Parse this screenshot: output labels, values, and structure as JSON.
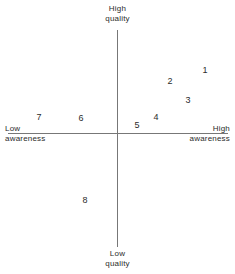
{
  "chart_data": {
    "type": "scatter",
    "title": "",
    "subtitle": "",
    "xlabel": "awareness",
    "ylabel": "quality",
    "xlim": [
      -1,
      1
    ],
    "ylim": [
      -1,
      1
    ],
    "grid": false,
    "legend": null,
    "axes": {
      "vertical": {
        "top_label": {
          "line1": "High",
          "line2": "quality"
        },
        "bottom_label": {
          "line1": "Low",
          "line2": "quality"
        }
      },
      "horizontal": {
        "left_label": {
          "line1": "Low",
          "line2": "awareness"
        },
        "right_label": {
          "line1": "High",
          "line2": "awareness"
        }
      }
    },
    "origin_px": {
      "x": 117,
      "y": 133
    },
    "labels": [
      "1",
      "2",
      "3",
      "4",
      "5",
      "6",
      "7",
      "8"
    ],
    "points": [
      {
        "label": "1",
        "x": 0.8,
        "y": 0.59,
        "px": 205,
        "py": 70,
        "quadrant": "high-awareness-high-quality"
      },
      {
        "label": "2",
        "x": 0.49,
        "y": 0.48,
        "px": 170,
        "py": 81,
        "quadrant": "high-awareness-high-quality"
      },
      {
        "label": "3",
        "x": 0.65,
        "y": 0.31,
        "px": 188,
        "py": 100,
        "quadrant": "high-awareness-high-quality"
      },
      {
        "label": "4",
        "x": 0.35,
        "y": 0.15,
        "px": 156,
        "py": 117,
        "quadrant": "high-awareness-high-quality"
      },
      {
        "label": "5",
        "x": 0.18,
        "y": 0.07,
        "px": 137,
        "py": 125,
        "quadrant": "high-awareness-high-quality"
      },
      {
        "label": "6",
        "x": -0.32,
        "y": 0.14,
        "px": 81,
        "py": 118,
        "quadrant": "low-awareness-high-quality"
      },
      {
        "label": "7",
        "x": -0.7,
        "y": 0.15,
        "px": 39,
        "py": 117,
        "quadrant": "low-awareness-high-quality"
      },
      {
        "label": "8",
        "x": -0.29,
        "y": -0.59,
        "px": 85,
        "py": 200,
        "quadrant": "low-awareness-low-quality"
      }
    ],
    "colors": {
      "axis": "#777777",
      "text": "#2b2b2b",
      "background": "#ffffff"
    }
  }
}
